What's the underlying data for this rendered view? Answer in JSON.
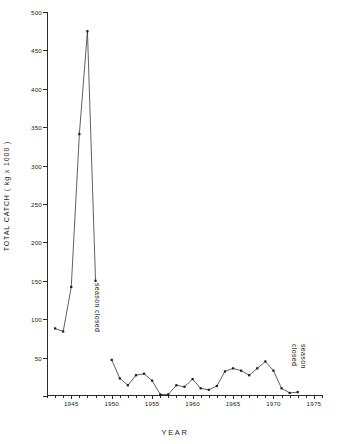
{
  "chart_data": {
    "type": "line",
    "title": "",
    "xlabel": "YEAR",
    "ylabel": "TOTAL  CATCH  ( kg x 1000 )",
    "xlim": [
      1942,
      1976
    ],
    "ylim": [
      0,
      500
    ],
    "grid": false,
    "legend": null,
    "y_ticks": [
      0,
      50,
      100,
      150,
      200,
      250,
      300,
      350,
      400,
      450,
      500
    ],
    "y_tick_labels": [
      "",
      "50",
      "100",
      "150",
      "200",
      "250",
      "300",
      "350",
      "400",
      "450",
      "500"
    ],
    "x_major_ticks": [
      1945,
      1950,
      1955,
      1960,
      1965,
      1970,
      1975
    ],
    "x_major_tick_labels": [
      "1945",
      "1950",
      "1955",
      "1960",
      "1965",
      "1970",
      "1975"
    ],
    "x_minor_tick_start": 1942,
    "x_minor_tick_end": 1976,
    "marker": "square",
    "line_color": "#2b2b2b",
    "series": [
      {
        "name": "total catch",
        "segments": [
          {
            "x": [
              1943,
              1944,
              1945,
              1946,
              1947,
              1948
            ],
            "y": [
              88,
              84,
              142,
              341,
              475,
              150
            ]
          },
          {
            "x": [
              1950,
              1951,
              1952,
              1953,
              1954,
              1955,
              1956,
              1957,
              1958,
              1959,
              1960,
              1961,
              1962,
              1963,
              1964,
              1965,
              1966,
              1967,
              1968,
              1969,
              1970,
              1971,
              1972,
              1973
            ],
            "y": [
              47,
              23,
              14,
              27,
              29,
              20,
              2,
              2,
              14,
              12,
              22,
              10,
              8,
              13,
              32,
              36,
              33,
              27,
              36,
              45,
              33,
              10,
              4,
              5
            ]
          }
        ]
      }
    ],
    "annotations": [
      {
        "name": "season-closed-left",
        "text": "season closed",
        "x": 1948.6,
        "y": 150,
        "rotation": 90
      },
      {
        "name": "season-closed-right",
        "text_line1": "season",
        "text_line2": "closed",
        "x": 1974.5,
        "y": 60,
        "rotation": 90
      }
    ]
  }
}
